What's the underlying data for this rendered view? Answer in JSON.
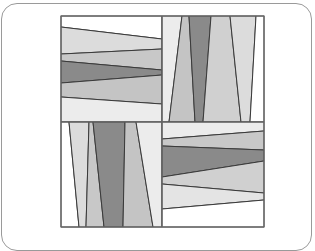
{
  "diagram": {
    "type": "quilt-block",
    "colors": {
      "white": "#ffffff",
      "near_white": "#ececec",
      "light": "#dcdcdc",
      "medium": "#c6c6c6",
      "dark": "#8a8a8a",
      "line": "#3a3a3a",
      "border": "#6a6a6a",
      "frame": "#9a9a9a"
    },
    "block": {
      "x0": 61,
      "y0": 16,
      "xmid": 162,
      "ymid": 122,
      "x1": 264,
      "y1": 227
    },
    "quadrants": [
      {
        "name": "top-left",
        "orientation": "horizontal",
        "patches": [
          {
            "fill": "#ffffff",
            "points": "61,16 162,16 162,39 61,27"
          },
          {
            "fill": "#dcdcdc",
            "points": "61,27 162,39 162,49 61,54"
          },
          {
            "fill": "#c8c8c8",
            "points": "61,54 162,49 162,70 61,61"
          },
          {
            "fill": "#8a8a8a",
            "points": "61,61 162,70 162,75 61,83"
          },
          {
            "fill": "#c4c4c4",
            "points": "61,83 162,75 162,104 61,97"
          },
          {
            "fill": "#ececec",
            "points": "61,97 162,104 162,122 61,122"
          }
        ]
      },
      {
        "name": "top-right",
        "orientation": "vertical",
        "patches": [
          {
            "fill": "#ececec",
            "points": "162,16 182,16 169,122 162,122"
          },
          {
            "fill": "#c4c4c4",
            "points": "182,16 189,16 195,122 169,122"
          },
          {
            "fill": "#8a8a8a",
            "points": "189,16 211,16 203,122 195,122"
          },
          {
            "fill": "#d0d0d0",
            "points": "211,16 230,16 241,122 203,122"
          },
          {
            "fill": "#dcdcdc",
            "points": "230,16 256,16 250,122 241,122"
          },
          {
            "fill": "#ffffff",
            "points": "256,16 264,16 264,122 250,122"
          }
        ]
      },
      {
        "name": "bottom-left",
        "orientation": "vertical",
        "patches": [
          {
            "fill": "#ffffff",
            "points": "61,122 69,122 79,227 61,227"
          },
          {
            "fill": "#dcdcdc",
            "points": "69,122 89,122 86,227 79,227"
          },
          {
            "fill": "#c8c8c8",
            "points": "89,122 93,122 104,227 86,227"
          },
          {
            "fill": "#8a8a8a",
            "points": "93,122 125,122 123,227 104,227"
          },
          {
            "fill": "#c4c4c4",
            "points": "125,122 136,122 153,227 123,227"
          },
          {
            "fill": "#ececec",
            "points": "136,122 162,122 162,227 153,227"
          }
        ]
      },
      {
        "name": "bottom-right",
        "orientation": "horizontal",
        "patches": [
          {
            "fill": "#ececec",
            "points": "162,122 264,122 264,131 162,139"
          },
          {
            "fill": "#c8c8c8",
            "points": "162,139 264,131 264,150 162,146"
          },
          {
            "fill": "#8a8a8a",
            "points": "162,146 264,150 264,161 162,177"
          },
          {
            "fill": "#d0d0d0",
            "points": "162,177 264,161 264,193 162,184"
          },
          {
            "fill": "#e4e4e4",
            "points": "162,184 264,193 264,200 162,209"
          },
          {
            "fill": "#ffffff",
            "points": "162,209 264,200 264,227 162,227"
          }
        ]
      }
    ]
  }
}
